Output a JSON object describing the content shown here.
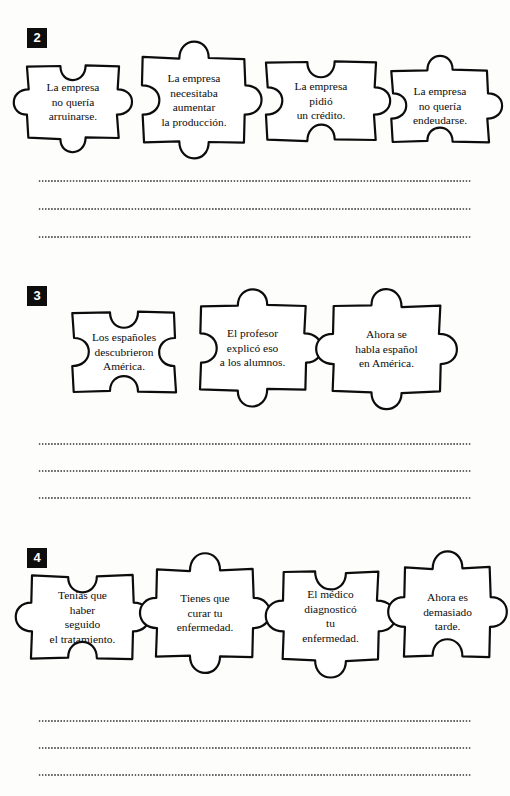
{
  "page": {
    "background_color": "#fdfdfc",
    "ink_color": "#0c0c0c",
    "badge_color": "#0d0d0d",
    "badge_text_color": "#ffffff",
    "line_color": "#4a4a4a"
  },
  "exercises": [
    {
      "number": "2",
      "badge_x": 27,
      "badge_y": 28,
      "row_top": 58,
      "pieces": [
        {
          "text": "La empresa\nno quería\narruinarse.",
          "x": 28,
          "y": 8,
          "w": 90,
          "h": 72,
          "top": "notch",
          "right": "tab",
          "bottom": "tab",
          "left": "tab"
        },
        {
          "text": "La empresa\nnecesitaba\naumentar\nla producción.",
          "x": 143,
          "y": 0,
          "w": 102,
          "h": 84,
          "top": "tab",
          "right": "tab",
          "bottom": "tab",
          "left": "notch"
        },
        {
          "text": "La empresa\npidió\nun crédito.",
          "x": 267,
          "y": 4,
          "w": 108,
          "h": 78,
          "top": "notch",
          "right": "tab",
          "bottom": "notch",
          "left": "notch"
        },
        {
          "text": "La empresa\nno quería\nendeudarse.",
          "x": 392,
          "y": 12,
          "w": 96,
          "h": 72,
          "top": "tab",
          "right": "tab",
          "bottom": "notch",
          "left": "notch"
        }
      ],
      "lines": [
        {
          "y": 180
        },
        {
          "y": 208
        },
        {
          "y": 236
        }
      ]
    },
    {
      "number": "3",
      "badge_x": 27,
      "badge_y": 286,
      "row_top": 306,
      "pieces": [
        {
          "text": "Los españoles\ndescubrieron\nAmérica.",
          "x": 73,
          "y": 6,
          "w": 102,
          "h": 80,
          "top": "notch",
          "right": "notch",
          "bottom": "notch",
          "left": "notch"
        },
        {
          "text": "El profesor\nexplicó eso\na los alumnos.",
          "x": 200,
          "y": 0,
          "w": 105,
          "h": 84,
          "top": "tab",
          "right": "tab",
          "bottom": "tab",
          "left": "notch"
        },
        {
          "text": "Ahora se\nhabla español\nen América.",
          "x": 333,
          "y": 0,
          "w": 107,
          "h": 86,
          "top": "tab",
          "right": "tab",
          "bottom": "tab",
          "left": "tab"
        }
      ],
      "lines": [
        {
          "y": 443
        },
        {
          "y": 470
        },
        {
          "y": 497
        }
      ]
    },
    {
      "number": "4",
      "badge_x": 27,
      "badge_y": 548,
      "row_top": 568,
      "pieces": [
        {
          "text": "Tenías que\nhaber\nseguido\nel tratamiento.",
          "x": 32,
          "y": 8,
          "w": 101,
          "h": 82,
          "top": "notch",
          "right": "tab",
          "bottom": "notch",
          "left": "tab"
        },
        {
          "text": "Tienes que\ncurar tu\nenfermedad.",
          "x": 157,
          "y": 2,
          "w": 96,
          "h": 86,
          "top": "tab",
          "right": "tab",
          "bottom": "tab",
          "left": "tab"
        },
        {
          "text": "El médico\ndiagnosticó\ntu\nenfermedad.",
          "x": 283,
          "y": 4,
          "w": 95,
          "h": 88,
          "top": "notch",
          "right": "tab",
          "bottom": "tab",
          "left": "tab"
        },
        {
          "text": "Ahora es\ndemasiado\ntarde.",
          "x": 405,
          "y": 0,
          "w": 85,
          "h": 88,
          "top": "tab",
          "right": "tab",
          "bottom": "notch",
          "left": "tab"
        }
      ],
      "lines": [
        {
          "y": 720
        },
        {
          "y": 747
        },
        {
          "y": 774
        }
      ]
    }
  ]
}
